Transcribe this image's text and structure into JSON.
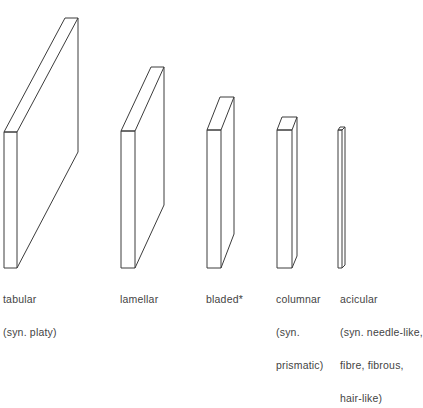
{
  "diagram": {
    "type": "crystal-habit-shapes",
    "stroke_color": "#3c3c3c",
    "background": "#ffffff",
    "shapes": [
      {
        "id": "tabular",
        "label_lines": [
          "tabular",
          "(syn. platy)"
        ],
        "front": {
          "x1": 4,
          "x2": 17,
          "top": 132,
          "bottom": 268
        },
        "back": {
          "x1": 65,
          "x2": 78,
          "top": 18,
          "right_bottom": 152
        },
        "label_pos": {
          "x": 3,
          "y": 272
        }
      },
      {
        "id": "lamellar",
        "label_lines": [
          "lamellar"
        ],
        "front": {
          "x1": 121,
          "x2": 135,
          "top": 131,
          "bottom": 268
        },
        "back": {
          "x1": 151,
          "x2": 164,
          "top": 67,
          "right_bottom": 205
        },
        "label_pos": {
          "x": 120,
          "y": 272
        }
      },
      {
        "id": "bladed",
        "label_lines": [
          "bladed*"
        ],
        "front": {
          "x1": 207,
          "x2": 221,
          "top": 130,
          "bottom": 268
        },
        "back": {
          "x1": 220,
          "x2": 234,
          "top": 97,
          "right_bottom": 234
        },
        "label_pos": {
          "x": 206,
          "y": 272
        }
      },
      {
        "id": "columnar",
        "label_lines": [
          "columnar",
          "(syn.",
          "prismatic)"
        ],
        "front": {
          "x1": 277,
          "x2": 292,
          "top": 130,
          "bottom": 268
        },
        "back": {
          "x1": 282,
          "x2": 297,
          "top": 117,
          "right_bottom": 256
        },
        "label_pos": {
          "x": 276,
          "y": 272
        }
      },
      {
        "id": "acicular",
        "label_lines": [
          "acicular",
          "(syn. needle-like,",
          "fibre, fibrous,",
          "hair-like)"
        ],
        "front": {
          "x1": 338,
          "x2": 342,
          "top": 130,
          "bottom": 268
        },
        "back": {
          "x1": 340,
          "x2": 345,
          "top": 127,
          "right_bottom": 265
        },
        "label_pos": {
          "x": 340,
          "y": 272
        }
      }
    ]
  }
}
